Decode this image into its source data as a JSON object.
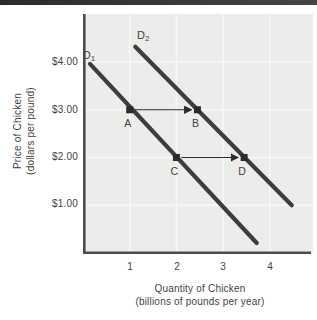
{
  "figure": {
    "top_bar_color": "#343434",
    "plot_bg_color": "#ececea",
    "grid_color": "#f8f8f6",
    "axis_color": "#4c4c4c",
    "curve_color": "#3d3d3d",
    "marker_color": "#2b2b2b",
    "text_color": "#3f3f3f"
  },
  "chart_data": {
    "type": "line",
    "title": "",
    "xlabel": "Quantity of Chicken",
    "xlabel_sub": "(billions of pounds per year)",
    "ylabel": "Price of Chicken",
    "ylabel_sub": "(dollars per pound)",
    "x_ticks": [
      1,
      2,
      3,
      4
    ],
    "y_ticks": [
      "$4.00",
      "$3.00",
      "$2.00",
      "$1.00"
    ],
    "x_axis_range": [
      0,
      4.9
    ],
    "y_axis_range": [
      0,
      5.0
    ],
    "grid": true,
    "legend": "labels-on-curves",
    "series": [
      {
        "name": "D1",
        "label_main": "D",
        "label_sub": "1",
        "x": [
          0.15,
          3.72
        ],
        "y": [
          3.96,
          0.21
        ]
      },
      {
        "name": "D2",
        "label_main": "D",
        "label_sub": "2",
        "x": [
          1.12,
          4.47
        ],
        "y": [
          4.32,
          1.0
        ]
      }
    ],
    "points": [
      {
        "label": "A",
        "x": 1.0,
        "y": 3.0
      },
      {
        "label": "B",
        "x": 2.45,
        "y": 3.0
      },
      {
        "label": "C",
        "x": 2.0,
        "y": 2.0
      },
      {
        "label": "D",
        "x": 3.45,
        "y": 2.0
      }
    ],
    "arrows": [
      {
        "from": "A",
        "to": "B",
        "from_x": 1.0,
        "to_x": 2.45,
        "at_y": 3.0
      },
      {
        "from": "C",
        "to": "D",
        "from_x": 2.0,
        "to_x": 3.45,
        "at_y": 2.0
      }
    ]
  }
}
